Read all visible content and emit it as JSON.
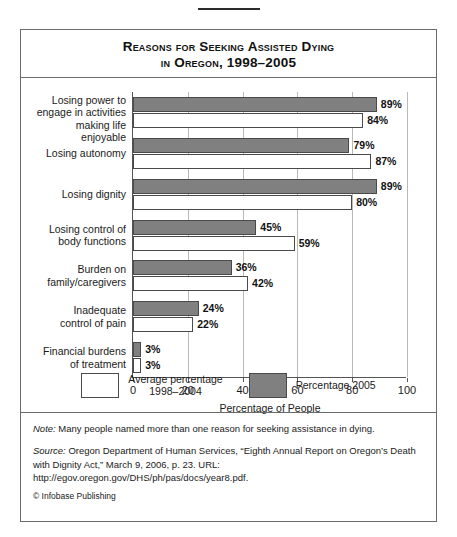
{
  "figure": {
    "title_line1": "Reasons for Seeking Assisted Dying",
    "title_line2": "in Oregon, 1998–2005",
    "note_label": "Note:",
    "note_text": " Many people named more than one reason for seeking assistance in dying.",
    "source_label": "Source:",
    "source_text": " Oregon Department of Human Services, “Eighth Annual Report on Oregon’s Death with Dignity Act,” March 9, 2006, p. 23. URL: http://egov.oregon.gov/DHS/ph/pas/docs/year8.pdf.",
    "copyright": "© Infobase Publishing"
  },
  "legend": {
    "items": [
      {
        "name": "average-swatch",
        "style": "white",
        "line1": "Average percentage",
        "line2": "1998–2004"
      },
      {
        "name": "percentage-2005-swatch",
        "style": "gray",
        "line1": "Percentage 2005",
        "line2": ""
      }
    ]
  },
  "colors": {
    "bar_2005": "#808080",
    "bar_average": "#ffffff",
    "outline": "#4a4a4a",
    "grid": "#b9b9b9"
  },
  "chart_data": {
    "type": "bar",
    "orientation": "horizontal",
    "title": "Reasons for Seeking Assisted Dying in Oregon, 1998–2005",
    "xlabel": "Percentage of People",
    "ylabel": "",
    "xlim": [
      0,
      100
    ],
    "xticks": [
      0,
      20,
      40,
      60,
      80,
      100
    ],
    "grid": true,
    "legend_position": "bottom",
    "categories": [
      "Losing power to engage in activities making life enjoyable",
      "Losing autonomy",
      "Losing dignity",
      "Losing control of body functions",
      "Burden on family/caregivers",
      "Inadequate control of pain",
      "Financial burdens of treatment"
    ],
    "category_lines": [
      [
        "Losing power to",
        "engage in activities",
        "making life enjoyable"
      ],
      [
        "Losing autonomy"
      ],
      [
        "Losing dignity"
      ],
      [
        "Losing control of",
        "body functions"
      ],
      [
        "Burden on",
        "family/caregivers"
      ],
      [
        "Inadequate",
        "control of pain"
      ],
      [
        "Financial burdens",
        "of treatment"
      ]
    ],
    "series": [
      {
        "name": "Percentage 2005",
        "style": "gray",
        "values": [
          89,
          79,
          89,
          45,
          36,
          24,
          3
        ],
        "labels": [
          "89%",
          "79%",
          "89%",
          "45%",
          "36%",
          "24%",
          "3%"
        ]
      },
      {
        "name": "Average percentage 1998–2004",
        "style": "white",
        "values": [
          84,
          87,
          80,
          59,
          42,
          22,
          3
        ],
        "labels": [
          "84%",
          "87%",
          "80%",
          "59%",
          "42%",
          "22%",
          "3%"
        ]
      }
    ]
  }
}
